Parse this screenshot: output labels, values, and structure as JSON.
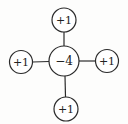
{
  "diagram": {
    "type": "five-point-stencil",
    "center": {
      "label": "−4",
      "x": 64,
      "y": 61,
      "r": 15
    },
    "neighbors": [
      {
        "position": "top",
        "label": "+1",
        "x": 64,
        "y": 20,
        "r": 12
      },
      {
        "position": "left",
        "label": "+1",
        "x": 21,
        "y": 62,
        "r": 11.5
      },
      {
        "position": "right",
        "label": "+1",
        "x": 107,
        "y": 61,
        "r": 11.5
      },
      {
        "position": "bottom",
        "label": "+1",
        "x": 66,
        "y": 109,
        "r": 12
      }
    ],
    "colors": {
      "stroke": "#2a2a2a",
      "text": "#222222",
      "background": "#fdfdfc"
    }
  }
}
